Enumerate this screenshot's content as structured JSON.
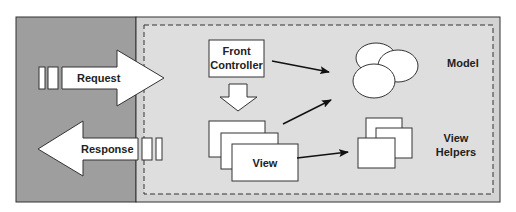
{
  "diagram": {
    "colors": {
      "outer_left": "#9e9e9e",
      "outer_right": "#d6d6d6",
      "dashed_region": "#dcdcdc",
      "shape_fill": "#ffffff",
      "stroke": "#222222"
    },
    "nodes": {
      "request": {
        "label": "Request"
      },
      "response": {
        "label": "Response"
      },
      "front_controller": {
        "label_line1": "Front",
        "label_line2": "Controller"
      },
      "view": {
        "label": "View"
      },
      "model": {
        "label": "Model"
      },
      "view_helpers": {
        "label_line1": "View",
        "label_line2": "Helpers"
      }
    },
    "edges": [
      {
        "from": "request",
        "to": "front_controller",
        "type": "block-arrow"
      },
      {
        "from": "front_controller",
        "to": "view",
        "type": "block-arrow-down"
      },
      {
        "from": "front_controller",
        "to": "model",
        "type": "arrow"
      },
      {
        "from": "view",
        "to": "model",
        "type": "arrow"
      },
      {
        "from": "view",
        "to": "view_helpers",
        "type": "arrow"
      },
      {
        "from": "view",
        "to": "response",
        "type": "block-arrow"
      }
    ]
  }
}
